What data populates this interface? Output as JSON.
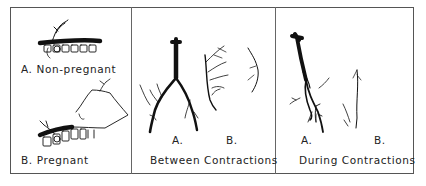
{
  "figure": {
    "panels": [
      {
        "id": "uterus-position",
        "sub_labels": [
          {
            "letter": "A.",
            "text": "Non-pregnant"
          },
          {
            "letter": "B.",
            "text": "Pregnant"
          }
        ]
      },
      {
        "id": "between-contractions",
        "title": "Between Contractions",
        "sub_labels": [
          {
            "letter": "A."
          },
          {
            "letter": "B."
          }
        ]
      },
      {
        "id": "during-contractions",
        "title": "During Contractions",
        "sub_labels": [
          {
            "letter": "A."
          },
          {
            "letter": "B."
          }
        ]
      }
    ],
    "colors": {
      "ink": "#111111",
      "border": "#555555",
      "background": "#ffffff"
    }
  }
}
